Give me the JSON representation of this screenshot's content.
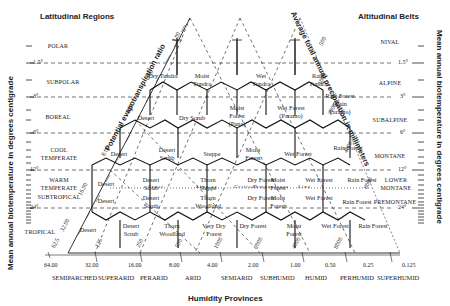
{
  "titles": {
    "latitudinal": "Latitudinal Regions",
    "altitudinal": "Altitudinal Belts",
    "humidity": "Humidity Provinces",
    "left_axis": "Mean annual biotemperature in degrees centigrade",
    "right_axis": "Mean annual biotemperature in degrees centigrade",
    "pet_axis": "Potential evapotranspiration ratio",
    "precip_axis": "Average total annual precipitation in millimeters"
  },
  "latitudinal_regions": [
    "POLAR",
    "SUBPOLAR",
    "BOREAL",
    "COOL TEMPERATE",
    "WARM TEMPERATE",
    "SUBTROPICAL",
    "TROPICAL"
  ],
  "altitudinal_belts": [
    "NIVAL",
    "ALPINE",
    "SUBALPINE",
    "MONTANE",
    "LOWER MONTANE",
    "PREMONTANE"
  ],
  "temperature_ticks": [
    "1.5°",
    "3°",
    "6°",
    "12°",
    "24°"
  ],
  "pet_ticks": [
    "0.125",
    "0.25",
    "0.50",
    "1.00",
    "2.00",
    "4.00",
    "8.00",
    "16.00",
    "32.00"
  ],
  "precip_ticks": [
    "62.5",
    "125",
    "250",
    "500",
    "1000",
    "2000",
    "4000",
    "8000"
  ],
  "humidity_ratio_ticks": [
    "64.00",
    "32.00",
    "16.00",
    "8.00",
    "4.00",
    "2.00",
    "1.00",
    "0.50",
    "0.25",
    "0.125"
  ],
  "humidity_provinces": [
    "SEMIPARCHED",
    "SUPERARID",
    "PERARID",
    "ARID",
    "SEMIARID",
    "SUBHUMID",
    "HUMID",
    "PERHUMID",
    "SUPERHUMID"
  ],
  "special_lines": [
    "Frost",
    "Line or",
    "Critical",
    "Temperature",
    "Line"
  ],
  "zones": {
    "polar": [
      "Desert"
    ],
    "subpolar": [
      "Dry Tundra",
      "Moist Tundra",
      "Wet Tundra",
      "Rain Tundra"
    ],
    "boreal": [
      "Desert",
      "Dry Scrub",
      "Moist Forest (Puna)",
      "Wet Forest (Paramo)",
      "Rain Forest (Rain Paramo)"
    ],
    "cool_temperate": [
      "Desert",
      "Desert Scrub",
      "Steppe",
      "Moist Forest",
      "Wet Forest",
      "Rain Forest"
    ],
    "warm_temperate": [
      "Desert",
      "Desert Scrub",
      "Thorn Steppe",
      "Dry Forest",
      "Moist Forest",
      "Wet Forest",
      "Rain Forest"
    ],
    "subtropical": [
      "Desert",
      "Desert Scrub",
      "Thorn Woodland",
      "Dry Forest",
      "Moist Forest",
      "Wet Forest",
      "Rain Forest"
    ],
    "tropical": [
      "Desert",
      "Desert Scrub",
      "Thorn Woodland",
      "Very Dry Forest",
      "Dry Forest",
      "Moist Forest",
      "Wet Forest",
      "Rain Forest"
    ]
  }
}
